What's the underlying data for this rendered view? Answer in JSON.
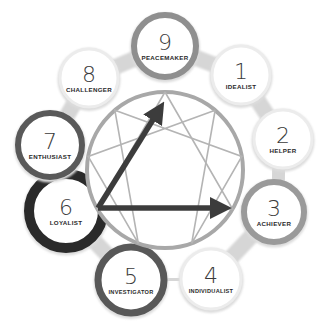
{
  "diagram": {
    "center": {
      "x": 165,
      "y": 170,
      "r": 78
    },
    "ring_color": "#a8a8a8",
    "line_color": "#b4b4b4",
    "arrow_color": "#3c3c3c",
    "types": [
      {
        "number": "9",
        "label": "PEACEMAKER",
        "cx": 165,
        "cy": 46,
        "r": 31,
        "stroke": "#8f8f8f",
        "stroke_width": 6
      },
      {
        "number": "1",
        "label": "IDEALIST",
        "cx": 241,
        "cy": 75,
        "r": 29,
        "stroke": "#ececec",
        "stroke_width": 3
      },
      {
        "number": "2",
        "label": "HELPER",
        "cx": 283,
        "cy": 139,
        "r": 29,
        "stroke": "#ececec",
        "stroke_width": 3
      },
      {
        "number": "3",
        "label": "ACHIEVER",
        "cx": 274,
        "cy": 212,
        "r": 30,
        "stroke": "#9a9a9a",
        "stroke_width": 6
      },
      {
        "number": "4",
        "label": "INDIVIDUALIST",
        "cx": 211,
        "cy": 279,
        "r": 30,
        "stroke": "#ececec",
        "stroke_width": 3
      },
      {
        "number": "5",
        "label": "INVESTIGATOR",
        "cx": 131,
        "cy": 280,
        "r": 33,
        "stroke": "#585858",
        "stroke_width": 7
      },
      {
        "number": "6",
        "label": "LOYALIST",
        "cx": 66,
        "cy": 211,
        "r": 37,
        "stroke": "#2a2a2a",
        "stroke_width": 10
      },
      {
        "number": "7",
        "label": "ENTHUSIAST",
        "cx": 50,
        "cy": 145,
        "r": 32,
        "stroke": "#595959",
        "stroke_width": 6
      },
      {
        "number": "8",
        "label": "CHALLENGER",
        "cx": 89,
        "cy": 78,
        "r": 29,
        "stroke": "#ececec",
        "stroke_width": 3
      }
    ],
    "arrows": [
      {
        "from": "6",
        "to": "9",
        "x1": 98,
        "y1": 208,
        "x2": 159,
        "y2": 110
      },
      {
        "from": "6",
        "to": "3",
        "x1": 98,
        "y1": 208,
        "x2": 222,
        "y2": 208
      }
    ]
  }
}
